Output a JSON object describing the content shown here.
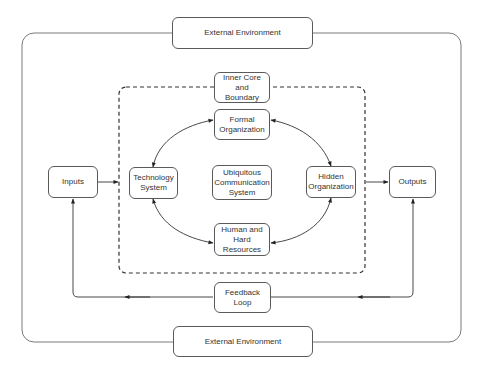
{
  "diagram": {
    "nodes": {
      "external_top": {
        "label": "External Environment"
      },
      "inner_core": {
        "label": "Inner Core and\nBoundary"
      },
      "formal_org": {
        "label": "Formal\nOrganization"
      },
      "technology": {
        "label": "Technology\nSystem"
      },
      "ubiquitous": {
        "label": "Ubiquitous\nCommunication\nSystem"
      },
      "hidden_org": {
        "label": "Hidden\nOrganization"
      },
      "human": {
        "label": "Human and\nHard\nResources"
      },
      "inputs": {
        "label": "Inputs"
      },
      "outputs": {
        "label": "Outputs"
      },
      "feedback": {
        "label": "Feedback Loop"
      },
      "external_bottom": {
        "label": "External Environment"
      }
    },
    "edges": [
      {
        "from": "Inputs",
        "to": "Inner Core and Boundary",
        "style": "solid-arrow"
      },
      {
        "from": "Inner Core and Boundary",
        "to": "Outputs",
        "style": "solid-arrow"
      },
      {
        "from": "Technology System",
        "to": "Formal Organization",
        "style": "bidirectional-curve"
      },
      {
        "from": "Formal Organization",
        "to": "Hidden Organization",
        "style": "bidirectional-curve"
      },
      {
        "from": "Hidden Organization",
        "to": "Human and Hard Resources",
        "style": "bidirectional-curve"
      },
      {
        "from": "Human and Hard Resources",
        "to": "Technology System",
        "style": "bidirectional-curve"
      },
      {
        "from": "Outputs",
        "to": "Feedback Loop",
        "style": "arrow"
      },
      {
        "from": "Feedback Loop",
        "to": "Inputs",
        "style": "arrow"
      }
    ],
    "colors": {
      "stroke": "#5a5a5a",
      "text": "#333333",
      "background": "#ffffff"
    }
  }
}
